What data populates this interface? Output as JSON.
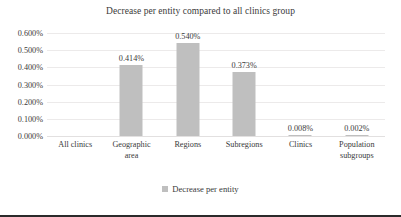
{
  "chart_data": {
    "type": "bar",
    "title": "Decrease per entity compared to all clinics group",
    "xlabel": "",
    "ylabel": "",
    "categories": [
      "All clinics",
      "Geographic area",
      "Regions",
      "Subregions",
      "Clinics",
      "Population subgroups"
    ],
    "category_lines": [
      [
        "All clinics"
      ],
      [
        "Geographic",
        "area"
      ],
      [
        "Regions"
      ],
      [
        "Subregions"
      ],
      [
        "Clinics"
      ],
      [
        "Population",
        "subgroups"
      ]
    ],
    "series": [
      {
        "name": "Decrease per entity",
        "values": [
          0.0,
          0.414,
          0.54,
          0.373,
          0.008,
          0.002
        ],
        "color": "#bfbfbf"
      }
    ],
    "data_labels": [
      "",
      "0.414%",
      "0.540%",
      "0.373%",
      "0.008%",
      "0.002%"
    ],
    "ylim": [
      0.0,
      0.6
    ],
    "ytick_values": [
      0.6,
      0.5,
      0.4,
      0.3,
      0.2,
      0.1,
      0.0
    ],
    "ytick_labels": [
      "0.600%",
      "0.500%",
      "0.400%",
      "0.300%",
      "0.200%",
      "0.100%",
      "0.000%"
    ],
    "grid": true,
    "legend_position": "bottom",
    "legend_entries": [
      "Decrease per entity"
    ],
    "value_unit": "%",
    "background_color": "#ffffff",
    "text_color": "#3a3a3a"
  }
}
